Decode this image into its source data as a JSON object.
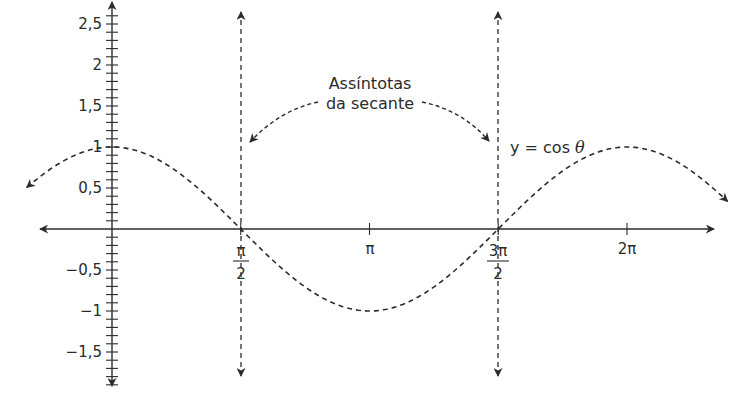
{
  "chart_data": {
    "type": "line",
    "title": "",
    "xlabel": "",
    "ylabel": "",
    "series": [
      {
        "name": "y = cos θ",
        "function": "cos",
        "style": "dashed",
        "x_range_rad": [
          -1.04,
          7.51
        ],
        "x": [
          "0",
          "π/2",
          "π",
          "3π/2",
          "2π"
        ],
        "values": [
          1,
          0,
          -1,
          0,
          1
        ]
      }
    ],
    "asymptotes": [
      {
        "name": "Assíntota da secante",
        "x": "π/2",
        "style": "dashed"
      },
      {
        "name": "Assíntota da secante",
        "x": "3π/2",
        "style": "dashed"
      }
    ],
    "x_ticks": [
      {
        "value_rad": 1.5708,
        "label_num": "π",
        "label_den": "2"
      },
      {
        "value_rad": 3.1416,
        "label": "π"
      },
      {
        "value_rad": 4.7124,
        "label_num": "3π",
        "label_den": "2"
      },
      {
        "value_rad": 6.2832,
        "label": "2π"
      }
    ],
    "y_ticks": [
      {
        "value": 2.5,
        "label": "2,5"
      },
      {
        "value": 2,
        "label": "2"
      },
      {
        "value": 1.5,
        "label": "1,5"
      },
      {
        "value": 1,
        "label": "1"
      },
      {
        "value": 0.5,
        "label": "0,5"
      },
      {
        "value": -0.5,
        "label": "−0,5"
      },
      {
        "value": -1,
        "label": "−1"
      },
      {
        "value": -1.5,
        "label": "−1,5"
      }
    ],
    "y_minor_tick_step": 0.1,
    "ylim": [
      -1.9,
      2.7
    ],
    "xlim_rad": [
      -1.05,
      7.55
    ],
    "grid": false,
    "legend": "none",
    "annotations": [
      {
        "text_line1": "Assíntotas",
        "text_line2": "da secante",
        "points_to": [
          "x = π/2",
          "x = 3π/2"
        ]
      },
      {
        "text": "y = cos θ",
        "near": "right peak"
      }
    ]
  },
  "labels": {
    "asymptote_note_line1": "Assíntotas",
    "asymptote_note_line2": "da secante",
    "curve_label_prefix": "y = cos ",
    "curve_label_var": "θ",
    "y_ticks": [
      "2,5",
      "2",
      "1,5",
      "1",
      "0,5",
      "−0,5",
      "−1",
      "−1,5"
    ],
    "x_tick_pi": "π",
    "x_tick_2pi": "2π",
    "x_tick_pi_half_num": "π",
    "x_tick_pi_half_den": "2",
    "x_tick_3pi_half_num": "3π",
    "x_tick_3pi_half_den": "2"
  },
  "colors": {
    "ink": "#2b2b2b",
    "background": "#ffffff"
  }
}
